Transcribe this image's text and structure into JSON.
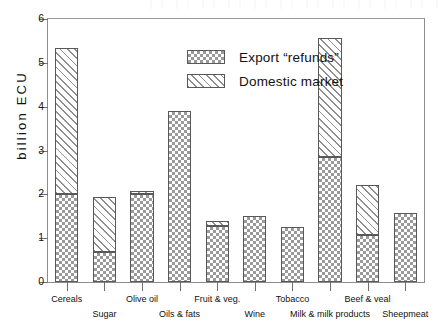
{
  "chart_data": {
    "type": "bar",
    "subtype": "stacked",
    "title": "",
    "xlabel": "",
    "ylabel": "billion ECU",
    "ylim": [
      0,
      6
    ],
    "yticks": [
      0,
      1,
      2,
      3,
      4,
      5,
      6
    ],
    "ytick_labels": [
      "0",
      "1",
      "2",
      "3",
      "4",
      "5",
      "6"
    ],
    "grid": false,
    "legend_position": "upper center",
    "categories": [
      "Cereals",
      "Sugar",
      "Olive oil",
      "Oils & fats",
      "Fruit & veg.",
      "Wine",
      "Tobacco",
      "Milk & milk products",
      "Beef & veal",
      "Sheepmeat"
    ],
    "series": [
      {
        "name": "Export “refunds”",
        "pattern": "checkerboard",
        "values": [
          2.0,
          0.68,
          2.0,
          3.9,
          1.28,
          1.5,
          1.25,
          2.85,
          1.08,
          1.58
        ]
      },
      {
        "name": "Domestic market",
        "pattern": "diagonal-hatch",
        "values": [
          3.35,
          1.27,
          0.08,
          0.0,
          0.12,
          0.0,
          0.0,
          2.72,
          1.14,
          0.0
        ]
      }
    ],
    "totals": [
      5.35,
      1.95,
      2.08,
      3.9,
      1.4,
      1.5,
      1.25,
      5.57,
      2.22,
      1.58
    ]
  },
  "legend": {
    "items": [
      {
        "label": "Export “refunds”"
      },
      {
        "label": "Domestic market"
      }
    ]
  },
  "axes": {
    "y_title": "billion ECU"
  },
  "colors": {
    "ink": "#111111",
    "frame": "#8d8d8d",
    "pattern": "#9a9a9a",
    "bar_outline": "#58585a",
    "background": "#ffffff"
  }
}
